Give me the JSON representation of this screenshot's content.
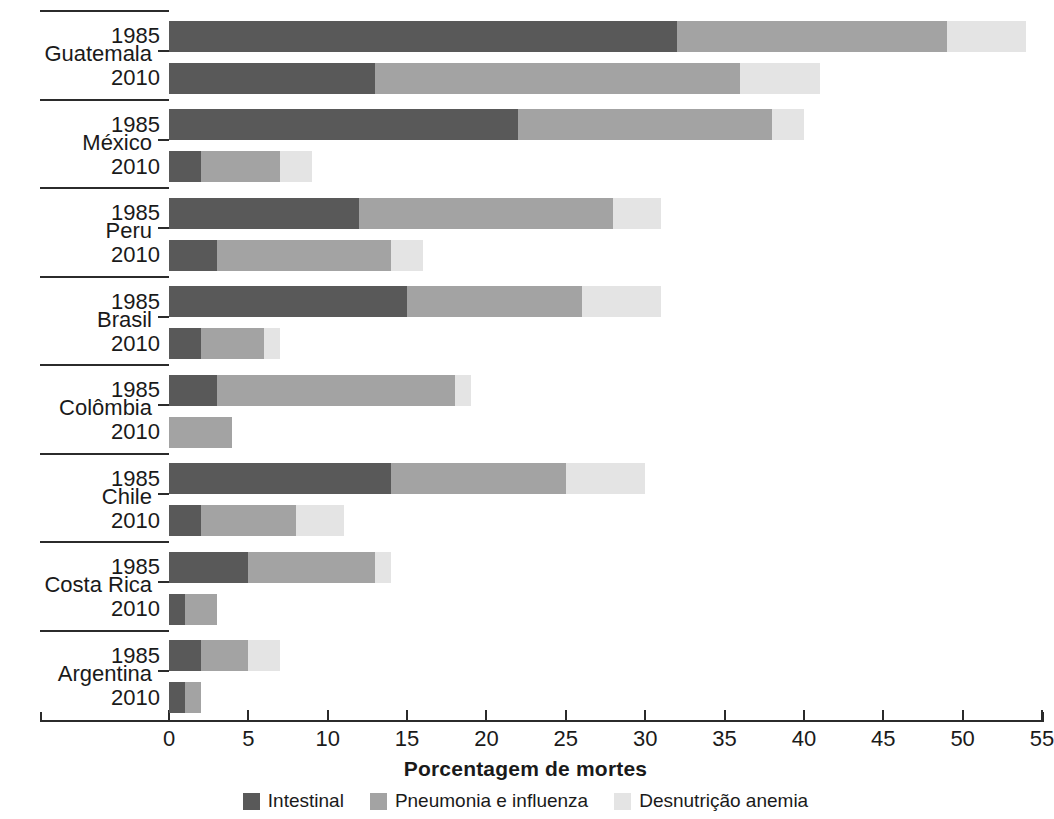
{
  "chart_data": {
    "type": "bar",
    "orientation": "horizontal",
    "stacked": true,
    "title": "",
    "xlabel": "Porcentagem de mortes",
    "ylabel": "",
    "xlim": [
      0,
      55
    ],
    "xticks": [
      0,
      5,
      10,
      15,
      20,
      25,
      30,
      35,
      40,
      45,
      50,
      55
    ],
    "xtick_labels": [
      "0",
      "5",
      "10",
      "15",
      "20",
      "25",
      "30",
      "35",
      "40",
      "45",
      "50",
      "55"
    ],
    "grid": false,
    "legend_position": "bottom",
    "series": [
      {
        "name": "Intestinal",
        "color": "#595959"
      },
      {
        "name": "Pneumonia e influenza",
        "color": "#a3a3a3"
      },
      {
        "name": "Desnutrição anemia",
        "color": "#e4e4e4"
      }
    ],
    "groups": [
      {
        "country": "Guatemala",
        "rows": [
          {
            "year": "1985",
            "values": [
              32,
              17,
              5
            ],
            "total": 54
          },
          {
            "year": "2010",
            "values": [
              13,
              23,
              5
            ],
            "total": 41
          }
        ]
      },
      {
        "country": "México",
        "rows": [
          {
            "year": "1985",
            "values": [
              22,
              16,
              2
            ],
            "total": 40
          },
          {
            "year": "2010",
            "values": [
              2,
              5,
              2
            ],
            "total": 9
          }
        ]
      },
      {
        "country": "Peru",
        "rows": [
          {
            "year": "1985",
            "values": [
              12,
              16,
              3
            ],
            "total": 31
          },
          {
            "year": "2010",
            "values": [
              3,
              11,
              2
            ],
            "total": 16
          }
        ]
      },
      {
        "country": "Brasil",
        "rows": [
          {
            "year": "1985",
            "values": [
              15,
              11,
              5
            ],
            "total": 31
          },
          {
            "year": "2010",
            "values": [
              2,
              4,
              1
            ],
            "total": 7
          }
        ]
      },
      {
        "country": "Colômbia",
        "rows": [
          {
            "year": "1985",
            "values": [
              3,
              15,
              1
            ],
            "total": 19
          },
          {
            "year": "2010",
            "values": [
              0,
              4,
              0
            ],
            "total": 4
          }
        ]
      },
      {
        "country": "Chile",
        "rows": [
          {
            "year": "1985",
            "values": [
              14,
              11,
              5
            ],
            "total": 30
          },
          {
            "year": "2010",
            "values": [
              2,
              6,
              3
            ],
            "total": 11
          }
        ]
      },
      {
        "country": "Costa Rica",
        "rows": [
          {
            "year": "1985",
            "values": [
              5,
              8,
              1
            ],
            "total": 14
          },
          {
            "year": "2010",
            "values": [
              1,
              2,
              0
            ],
            "total": 3
          }
        ]
      },
      {
        "country": "Argentina",
        "rows": [
          {
            "year": "1985",
            "values": [
              2,
              3,
              2
            ],
            "total": 7
          },
          {
            "year": "2010",
            "values": [
              1,
              1,
              0
            ],
            "total": 2
          }
        ]
      }
    ]
  },
  "axis": {
    "title": "Porcentagem de mortes"
  },
  "legend": {
    "items": [
      {
        "label": "Intestinal",
        "color": "#595959",
        "icon": "legend-swatch-icon"
      },
      {
        "label": "Pneumonia e influenza",
        "color": "#a3a3a3",
        "icon": "legend-swatch-icon"
      },
      {
        "label": "Desnutrição anemia",
        "color": "#e4e4e4",
        "icon": "legend-swatch-icon"
      }
    ]
  }
}
